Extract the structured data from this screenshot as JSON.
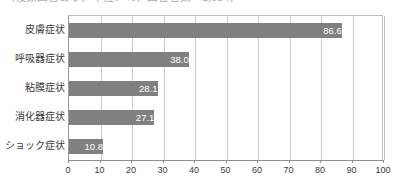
{
  "title": {
    "text": "（複数回答あり、単位：％、回答者数＝1,054）",
    "clipped": true
  },
  "chart_data": {
    "type": "bar",
    "orientation": "horizontal",
    "title": "",
    "xlabel": "",
    "ylabel": "",
    "categories": [
      "皮膚症状",
      "呼吸器症状",
      "粘膜症状",
      "消化器症状",
      "ショック症状"
    ],
    "values": [
      86.6,
      38.0,
      28.1,
      27.1,
      10.8
    ],
    "value_labels": [
      "86.6",
      "38.0",
      "28.1",
      "27.1",
      "10.8"
    ],
    "xlim": [
      0,
      100
    ],
    "xticks": [
      0,
      10,
      20,
      30,
      40,
      50,
      60,
      70,
      80,
      90,
      100
    ],
    "xtick_labels": [
      "0",
      "10",
      "20",
      "30",
      "40",
      "50",
      "60",
      "70",
      "80",
      "90",
      "100"
    ],
    "grid": true,
    "legend": null,
    "bar_color": "#808080",
    "value_label_color": "#ffffff",
    "grid_color": "#cccccc",
    "axis_color": "#8f8f8f"
  }
}
